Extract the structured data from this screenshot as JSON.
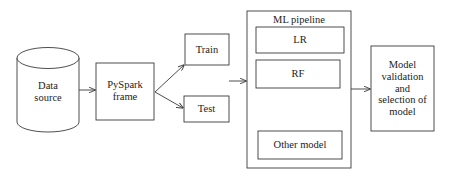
{
  "diagram": {
    "stroke_color": "#3a3a3a",
    "fill_color": "#ffffff",
    "text_color": "#1c1c1c",
    "background": "#ffffff",
    "nodes": {
      "data_source": {
        "label": "Data\nsource",
        "shape": "cylinder"
      },
      "pyspark_frame": {
        "label": "PySpark\nframe",
        "shape": "rect"
      },
      "train": {
        "label": "Train",
        "shape": "rect"
      },
      "test": {
        "label": "Test",
        "shape": "rect"
      },
      "ml_pipeline": {
        "label": "ML pipeline",
        "shape": "rect-container"
      },
      "lr": {
        "label": "LR",
        "shape": "rect"
      },
      "rf": {
        "label": "RF",
        "shape": "rect"
      },
      "other_model": {
        "label": "Other model",
        "shape": "rect"
      },
      "model_validation": {
        "label": "Model\nvalidation\nand\nselection of\nmodel",
        "shape": "rect"
      }
    },
    "edges": [
      {
        "name": "data-source-to-pyspark",
        "from": "data_source",
        "to": "pyspark_frame"
      },
      {
        "name": "pyspark-to-train",
        "from": "pyspark_frame",
        "to": "train"
      },
      {
        "name": "pyspark-to-test",
        "from": "pyspark_frame",
        "to": "test"
      },
      {
        "name": "split-to-ml-pipeline",
        "from": "train_test",
        "to": "ml_pipeline"
      },
      {
        "name": "ml-pipeline-to-validation",
        "from": "ml_pipeline",
        "to": "model_validation"
      }
    ]
  }
}
